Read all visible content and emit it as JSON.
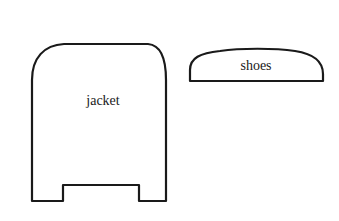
{
  "diagram": {
    "shapes": [
      {
        "id": "jacket",
        "label": "jacket",
        "description": "Tall rounded-top outline with a rectangular notch cut into the bottom edge"
      },
      {
        "id": "shoes",
        "label": "shoes",
        "description": "Wide low dome outline with a flat bottom"
      }
    ],
    "colors": {
      "stroke": "#1a1a1a",
      "background": "#ffffff"
    }
  }
}
